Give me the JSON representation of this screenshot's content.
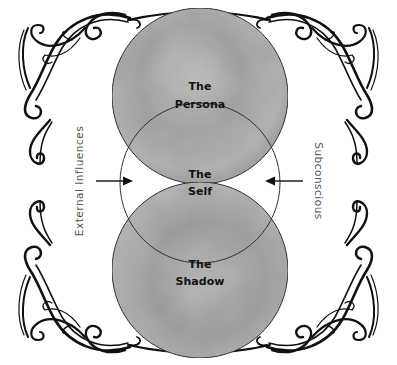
{
  "diagram": {
    "title": "",
    "nodes": {
      "persona": {
        "line1": "The",
        "line2": "Persona"
      },
      "self": {
        "line1": "The",
        "line2": "Self"
      },
      "shadow": {
        "line1": "The",
        "line2": "Shadow"
      }
    },
    "side_labels": {
      "left": "External Influences",
      "right": "Subconscious"
    },
    "arrows": [
      {
        "from": "External Influences",
        "to": "The Self",
        "direction": "right"
      },
      {
        "from": "Subconscious",
        "to": "The Self",
        "direction": "left"
      }
    ],
    "colors": {
      "circle_fill": "#a8a8a8",
      "circle_fill_light": "#c4c4c4",
      "outline": "#222222",
      "ornament": "#111111",
      "side_text": "#555555"
    }
  }
}
